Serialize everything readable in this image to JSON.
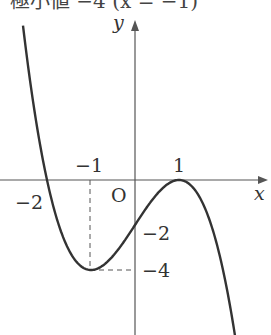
{
  "header_text": "極小値  −4  (x = −1)",
  "axes": {
    "x_label": "x",
    "y_label": "y",
    "origin_label": "O"
  },
  "ticks": {
    "x_neg2": "−2",
    "x_neg1": "−1",
    "x_pos1": "1",
    "y_neg2": "−2",
    "y_neg4": "−4"
  },
  "function": "y = −(x + 2)(x − 1)^2",
  "key_points": [
    {
      "x": -2,
      "y": 0,
      "label": "root"
    },
    {
      "x": 1,
      "y": 0,
      "label": "local max / double root"
    },
    {
      "x": -1,
      "y": -4,
      "label": "local min"
    },
    {
      "x": 0,
      "y": -2,
      "label": "y-intercept"
    }
  ],
  "colors": {
    "curve": "#333333",
    "axis": "#555555",
    "text": "#333333"
  }
}
